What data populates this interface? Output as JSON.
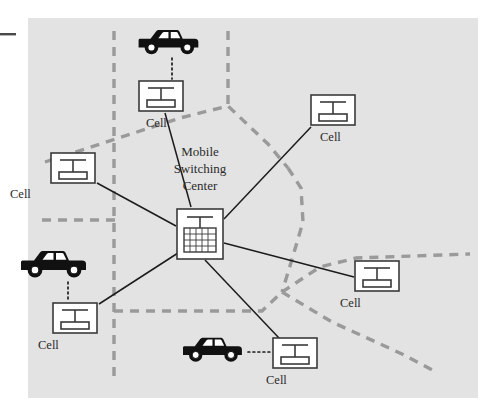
{
  "figure": {
    "background_color": "#ffffff",
    "panel_color": "#e3e3e3",
    "panel": {
      "x": 28,
      "y": 18,
      "width": 450,
      "height": 380
    },
    "edge_tick": {
      "x": 0,
      "y": 34,
      "width": 16,
      "color": "#4a4a4a"
    }
  },
  "colors": {
    "panel": "#e3e3e3",
    "node_fill": "#ffffff",
    "node_stroke": "#3a3a3a",
    "link_stroke": "#1c1c1c",
    "boundary_stroke": "#9a9a9a",
    "car_body": "#111111",
    "car_window": "#ffffff",
    "text": "#2b2b2b"
  },
  "center_node": {
    "label": "Mobile\nSwitching\nCenter",
    "label_lines": [
      "Mobile",
      "Switching",
      "Center"
    ],
    "icon": "switching-center-icon",
    "x": 176,
    "y": 208,
    "width": 48,
    "height": 52
  },
  "cells": [
    {
      "id": "cell-top",
      "label": "Cell",
      "icon": "cell-tower-icon",
      "x": 138,
      "y": 80,
      "width": 46,
      "height": 32,
      "label_x": 146,
      "label_y": 127
    },
    {
      "id": "cell-top-right",
      "label": "Cell",
      "icon": "cell-tower-icon",
      "x": 310,
      "y": 94,
      "width": 46,
      "height": 32,
      "label_x": 320,
      "label_y": 141
    },
    {
      "id": "cell-left",
      "label": "Cell",
      "icon": "cell-tower-icon",
      "x": 50,
      "y": 152,
      "width": 46,
      "height": 32,
      "label_x": 10,
      "label_y": 198
    },
    {
      "id": "cell-bottom-left",
      "label": "Cell",
      "icon": "cell-tower-icon",
      "x": 52,
      "y": 302,
      "width": 46,
      "height": 32,
      "label_x": 38,
      "label_y": 349
    },
    {
      "id": "cell-right",
      "label": "Cell",
      "icon": "cell-tower-icon",
      "x": 354,
      "y": 260,
      "width": 46,
      "height": 32,
      "label_x": 340,
      "label_y": 307
    },
    {
      "id": "cell-bottom",
      "label": "Cell",
      "icon": "cell-tower-icon",
      "x": 272,
      "y": 337,
      "width": 46,
      "height": 32,
      "label_x": 266,
      "label_y": 384
    }
  ],
  "cars": [
    {
      "id": "car-top",
      "icon": "car-icon",
      "x": 134,
      "y": 27,
      "width": 68,
      "height": 30,
      "facing": "left",
      "link_to": "cell-top",
      "link_style": "dotted",
      "link": {
        "x1": 172,
        "y1": 59,
        "x2": 172,
        "y2": 79
      }
    },
    {
      "id": "car-left",
      "icon": "car-icon",
      "x": 16,
      "y": 248,
      "width": 74,
      "height": 32,
      "facing": "left",
      "link_to": "cell-bottom-left",
      "link_style": "dotted",
      "link": {
        "x1": 68,
        "y1": 282,
        "x2": 68,
        "y2": 301
      }
    },
    {
      "id": "car-bottom",
      "icon": "car-icon",
      "x": 178,
      "y": 335,
      "width": 68,
      "height": 29,
      "facing": "left",
      "link_to": "cell-bottom",
      "link_style": "dotted",
      "link": {
        "x1": 247,
        "y1": 352,
        "x2": 271,
        "y2": 352
      }
    }
  ],
  "links": [
    {
      "id": "link-msc-cell-top",
      "from": "center_node",
      "to": "cell-top",
      "style": "solid",
      "x1": 191,
      "y1": 207,
      "x2": 165,
      "y2": 113
    },
    {
      "id": "link-msc-cell-top-right",
      "from": "center_node",
      "to": "cell-top-right",
      "style": "solid",
      "x1": 224,
      "y1": 218,
      "x2": 311,
      "y2": 127
    },
    {
      "id": "link-msc-cell-left",
      "from": "center_node",
      "to": "cell-left",
      "style": "solid",
      "x1": 176,
      "y1": 225,
      "x2": 97,
      "y2": 183
    },
    {
      "id": "link-msc-cell-bottom-left",
      "from": "center_node",
      "to": "cell-bottom-left",
      "style": "solid",
      "x1": 178,
      "y1": 253,
      "x2": 99,
      "y2": 303
    },
    {
      "id": "link-msc-cell-right",
      "from": "center_node",
      "to": "cell-right",
      "style": "solid",
      "x1": 224,
      "y1": 243,
      "x2": 354,
      "y2": 277
    },
    {
      "id": "link-msc-cell-bottom",
      "from": "center_node",
      "to": "cell-bottom",
      "style": "solid",
      "x1": 205,
      "y1": 260,
      "x2": 279,
      "y2": 338
    }
  ],
  "cell_boundaries": [
    {
      "id": "boundary-vertical-left",
      "points": "114,31 114,382"
    },
    {
      "id": "boundary-vertical-top",
      "points": "228,31 228,106"
    },
    {
      "id": "boundary-chevron",
      "points": "45,162 180,118 228,106 265,140 286,166"
    },
    {
      "id": "boundary-horiz-left",
      "points": "42,220 114,220"
    },
    {
      "id": "boundary-right-curve",
      "points": "286,166 300,186 302,222 286,272 282,292"
    },
    {
      "id": "boundary-horiz-mid",
      "points": "114,311 262,311 282,292"
    },
    {
      "id": "boundary-right-arm",
      "points": "282,292 320,266 354,258 470,254"
    },
    {
      "id": "boundary-bottom-right",
      "points": "282,292 330,320 400,352 438,372"
    }
  ]
}
